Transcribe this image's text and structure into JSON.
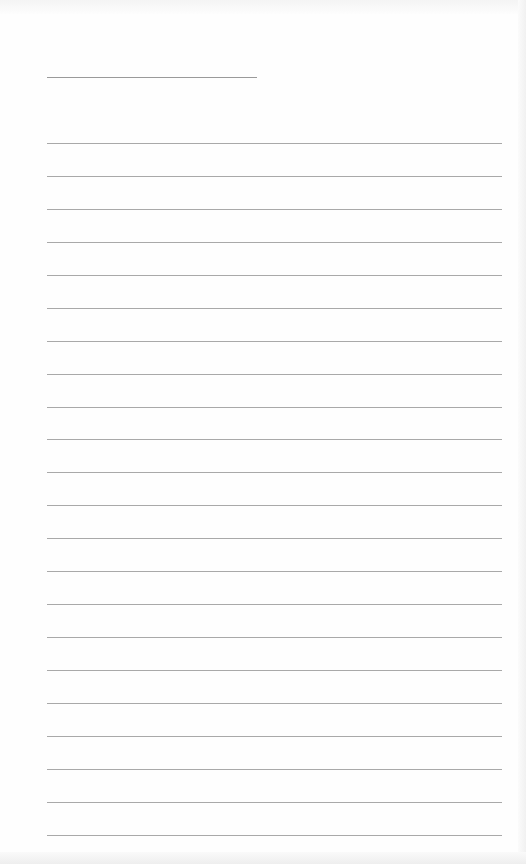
{
  "page": {
    "type": "ruled-sheet",
    "background": "#fefefe",
    "rule_color": "#a9a9a9",
    "title_line": {
      "text": "",
      "x": 47,
      "y": 77,
      "width": 210
    },
    "ruled_lines": {
      "count": 22,
      "first_y": 143,
      "spacing": 32.95,
      "x": 47,
      "width": 455,
      "texts": [
        "",
        "",
        "",
        "",
        "",
        "",
        "",
        "",
        "",
        "",
        "",
        "",
        "",
        "",
        "",
        "",
        "",
        "",
        "",
        "",
        "",
        ""
      ]
    }
  }
}
